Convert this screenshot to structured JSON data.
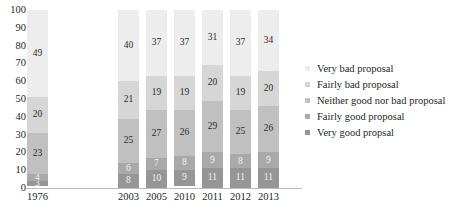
{
  "chart_data": {
    "type": "bar",
    "subtype": "stacked-percentage",
    "title": "",
    "xlabel": "",
    "ylabel": "",
    "ylim": [
      0,
      100
    ],
    "grid": false,
    "legend_position": "right",
    "categories": [
      "1976",
      "2003",
      "2005",
      "2010",
      "2011",
      "2012",
      "2013"
    ],
    "stack_order_top_to_bottom": [
      "Very bad proposal",
      "Fairly bad proposal",
      "Neither good nor bad proposal",
      "Fairly good proposal",
      "Very good propsal"
    ],
    "series": [
      {
        "name": "Very bad proposal",
        "values": [
          49,
          40,
          37,
          37,
          31,
          37,
          34
        ]
      },
      {
        "name": "Fairly bad proposal",
        "values": [
          20,
          21,
          19,
          19,
          20,
          19,
          20
        ]
      },
      {
        "name": "Neither good nor bad proposal",
        "values": [
          23,
          25,
          27,
          26,
          29,
          25,
          26
        ]
      },
      {
        "name": "Fairly good proposal",
        "values": [
          4,
          6,
          7,
          8,
          9,
          8,
          9
        ]
      },
      {
        "name": "Very good propsal",
        "values": [
          3,
          8,
          10,
          9,
          11,
          11,
          11
        ]
      }
    ],
    "y_ticks": [
      "100",
      "90",
      "80",
      "70",
      "60",
      "50",
      "40",
      "30",
      "20",
      "10",
      "0"
    ],
    "colors": [
      "#ededed",
      "#d6d6d6",
      "#c0c0c0",
      "#a9a9a9",
      "#969696"
    ]
  },
  "legend": {
    "items": [
      {
        "label": "Very bad proposal",
        "color": "#ededed"
      },
      {
        "label": "Fairly bad proposal",
        "color": "#d6d6d6"
      },
      {
        "label": "Neither good nor bad proposal",
        "color": "#c0c0c0"
      },
      {
        "label": "Fairly good proposal",
        "color": "#a9a9a9"
      },
      {
        "label": "Very good propsal",
        "color": "#969696"
      }
    ]
  }
}
